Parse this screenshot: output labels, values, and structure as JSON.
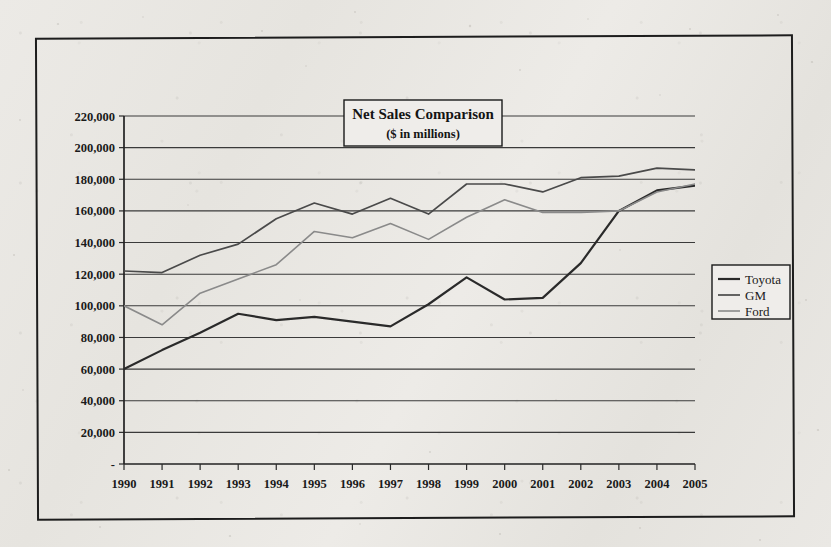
{
  "chart_data": {
    "type": "line",
    "title": "Net Sales Comparison",
    "subtitle": "($ in millions)",
    "xlabel": "",
    "ylabel": "",
    "grid": true,
    "legend_position": "right",
    "ylim": [
      0,
      220000
    ],
    "ytick_step": 20000,
    "ytick_labels": [
      "220,000",
      "200,000",
      "180,000",
      "160,000",
      "140,000",
      "120,000",
      "100,000",
      "80,000",
      "60,000",
      "40,000",
      "20,000",
      "-"
    ],
    "ytick_values": [
      220000,
      200000,
      180000,
      160000,
      140000,
      120000,
      100000,
      80000,
      60000,
      40000,
      20000,
      0
    ],
    "categories": [
      "1990",
      "1991",
      "1992",
      "1993",
      "1994",
      "1995",
      "1996",
      "1997",
      "1998",
      "1999",
      "2000",
      "2001",
      "2002",
      "2003",
      "2004",
      "2005"
    ],
    "x": [
      1990,
      1991,
      1992,
      1993,
      1994,
      1995,
      1996,
      1997,
      1998,
      1999,
      2000,
      2001,
      2002,
      2003,
      2004,
      2005
    ],
    "series": [
      {
        "name": "Toyota",
        "color": "#2a2a2a",
        "width": 2.2,
        "values": [
          60000,
          72000,
          83000,
          95000,
          91000,
          93000,
          90000,
          87000,
          101000,
          118000,
          104000,
          105000,
          127000,
          160000,
          173000,
          176000
        ]
      },
      {
        "name": "GM",
        "color": "#4a4a4a",
        "width": 1.7,
        "values": [
          122000,
          121000,
          132000,
          139000,
          155000,
          165000,
          158000,
          168000,
          158000,
          177000,
          177000,
          172000,
          181000,
          182000,
          187000,
          186000
        ]
      },
      {
        "name": "Ford",
        "color": "#8a8a8a",
        "width": 1.6,
        "values": [
          100000,
          88000,
          108000,
          117000,
          126000,
          147000,
          143000,
          152000,
          142000,
          156000,
          167000,
          159000,
          159000,
          160000,
          172000,
          177000
        ]
      }
    ]
  },
  "legend": {
    "items": [
      {
        "label": "Toyota"
      },
      {
        "label": "GM"
      },
      {
        "label": "Ford"
      }
    ]
  }
}
